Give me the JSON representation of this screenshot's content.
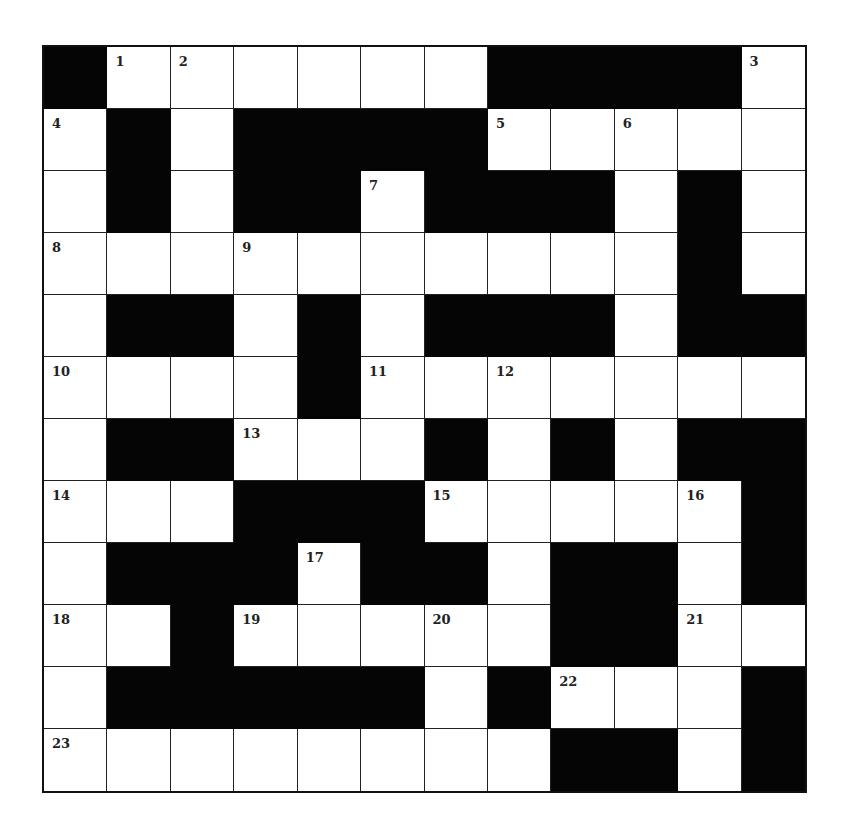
{
  "puzzle": {
    "rows": 12,
    "cols": 12,
    "legend": "B = black square, W = white square, number = numbered white square",
    "grid": [
      [
        "B",
        "1",
        "2",
        "W",
        "W",
        "W",
        "W",
        "B",
        "B",
        "B",
        "B",
        "3"
      ],
      [
        "4",
        "B",
        "W",
        "B",
        "B",
        "B",
        "B",
        "5",
        "W",
        "6",
        "W",
        "W"
      ],
      [
        "W",
        "B",
        "W",
        "B",
        "B",
        "7",
        "B",
        "B",
        "B",
        "W",
        "B",
        "W"
      ],
      [
        "8",
        "W",
        "W",
        "9",
        "W",
        "W",
        "W",
        "W",
        "W",
        "W",
        "B",
        "W"
      ],
      [
        "W",
        "B",
        "B",
        "W",
        "B",
        "W",
        "B",
        "B",
        "B",
        "W",
        "B",
        "B"
      ],
      [
        "10",
        "W",
        "W",
        "W",
        "B",
        "11",
        "W",
        "12",
        "W",
        "W",
        "W",
        "W"
      ],
      [
        "W",
        "B",
        "B",
        "13",
        "W",
        "W",
        "B",
        "W",
        "B",
        "W",
        "B",
        "B"
      ],
      [
        "14",
        "W",
        "W",
        "B",
        "B",
        "B",
        "15",
        "W",
        "W",
        "W",
        "16",
        "B"
      ],
      [
        "W",
        "B",
        "B",
        "B",
        "17",
        "B",
        "B",
        "W",
        "B",
        "B",
        "W",
        "B"
      ],
      [
        "18",
        "W",
        "B",
        "19",
        "W",
        "W",
        "20",
        "W",
        "B",
        "B",
        "21",
        "W"
      ],
      [
        "W",
        "B",
        "B",
        "B",
        "B",
        "B",
        "W",
        "B",
        "22",
        "W",
        "W",
        "B"
      ],
      [
        "23",
        "W",
        "W",
        "W",
        "W",
        "W",
        "W",
        "W",
        "B",
        "B",
        "W",
        "B"
      ]
    ],
    "clue_numbers": [
      1,
      2,
      3,
      4,
      5,
      6,
      7,
      8,
      9,
      10,
      11,
      12,
      13,
      14,
      15,
      16,
      17,
      18,
      19,
      20,
      21,
      22,
      23
    ],
    "colors": {
      "black_square": "#050505",
      "white_square": "#ffffff",
      "grid_line": "#222222",
      "number_text": "#222222"
    }
  }
}
